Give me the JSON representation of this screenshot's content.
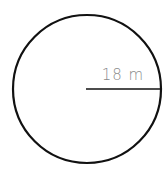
{
  "diagram": {
    "shape": "circle",
    "radius_label": "18 m",
    "colors": {
      "stroke": "#111111",
      "label": "#8a8a8a",
      "background": "#ffffff"
    }
  }
}
